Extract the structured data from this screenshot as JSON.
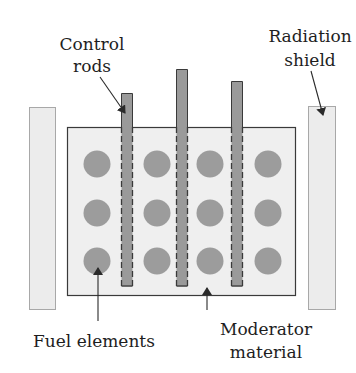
{
  "diagram": {
    "type": "nuclear-reactor-schematic",
    "colors": {
      "background": "#ffffff",
      "moderator_fill": "#efefef",
      "moderator_stroke": "#3a3a3a",
      "shield_fill": "#ececec",
      "shield_stroke": "#a8a8a8",
      "rod_fill": "#9a9a9a",
      "rod_stroke": "#3a3a3a",
      "fuel_fill": "#9c9c9c",
      "arrow": "#2a2a2a",
      "text": "#1e1e1e"
    },
    "labels": {
      "control_rods": [
        "Control",
        "rods"
      ],
      "radiation_shield": [
        "Radiation",
        "shield"
      ],
      "fuel_elements": [
        "Fuel elements"
      ],
      "moderator_material": [
        "Moderator",
        "material"
      ]
    },
    "components": {
      "left_shield": {
        "x": 29,
        "y": 107,
        "w": 27,
        "h": 203
      },
      "right_shield": {
        "x": 308,
        "y": 106,
        "w": 28,
        "h": 204
      },
      "moderator_block": {
        "x": 67,
        "y": 127,
        "w": 229,
        "h": 169
      },
      "control_rods": [
        {
          "x": 121,
          "top": 93,
          "bottom": 286,
          "w": 11
        },
        {
          "x": 176,
          "top": 69,
          "bottom": 286,
          "w": 11
        },
        {
          "x": 231,
          "top": 81,
          "bottom": 286,
          "w": 11
        }
      ],
      "fuel_elements": {
        "columns_cx": [
          97,
          157,
          210,
          268
        ],
        "rows_cy": [
          164,
          213,
          261
        ],
        "radius": 13.5,
        "count": 12
      }
    }
  }
}
